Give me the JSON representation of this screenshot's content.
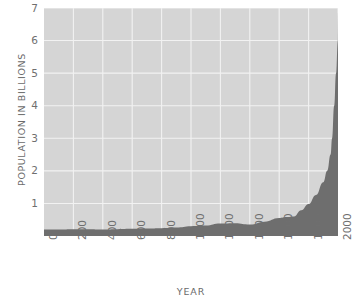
{
  "chart_data": {
    "type": "area",
    "title": "",
    "xlabel": "YEAR",
    "ylabel": "POPULATION IN BILLIONS",
    "xlim": [
      0,
      2000
    ],
    "ylim": [
      0,
      7
    ],
    "grid": true,
    "legend": "none",
    "xticks": [
      "0",
      "200",
      "400",
      "600",
      "800",
      "1000",
      "1200",
      "1400",
      "1600",
      "1800",
      "2000"
    ],
    "xtick_values": [
      0,
      200,
      400,
      600,
      800,
      1000,
      1200,
      1400,
      1600,
      1800,
      2000
    ],
    "yticks": [
      "1",
      "2",
      "3",
      "4",
      "5",
      "6",
      "7"
    ],
    "ytick_values": [
      1,
      2,
      3,
      4,
      5,
      6,
      7
    ],
    "series": [
      {
        "name": "World population",
        "x": [
          0,
          100,
          200,
          300,
          400,
          500,
          600,
          700,
          800,
          900,
          1000,
          1100,
          1200,
          1300,
          1400,
          1500,
          1600,
          1650,
          1700,
          1750,
          1800,
          1850,
          1900,
          1927,
          1950,
          1960,
          1974,
          1987,
          1999,
          2000
        ],
        "values": [
          0.2,
          0.2,
          0.21,
          0.21,
          0.2,
          0.21,
          0.22,
          0.23,
          0.24,
          0.26,
          0.3,
          0.32,
          0.38,
          0.39,
          0.35,
          0.44,
          0.55,
          0.58,
          0.6,
          0.79,
          0.98,
          1.26,
          1.65,
          2.0,
          2.5,
          3.0,
          4.0,
          5.0,
          6.0,
          6.9
        ]
      }
    ],
    "colors": {
      "plot_background": "#d5d5d5",
      "area_fill": "#6e6e6e",
      "gridline": "#f2f2f2",
      "text": "#6f6f6f",
      "page_background": "#ffffff"
    }
  }
}
